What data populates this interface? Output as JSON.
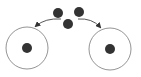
{
  "diagram": {
    "colors": {
      "background": "#ffffff",
      "particle": "#333333",
      "outline": "#888888",
      "arrow": "#444444"
    },
    "source_particles": [
      {
        "id": "p1",
        "cx": 58,
        "cy": 13,
        "r": 5
      },
      {
        "id": "p2",
        "cx": 79,
        "cy": 12,
        "r": 5
      },
      {
        "id": "p3",
        "cx": 68,
        "cy": 24,
        "r": 5
      }
    ],
    "arrows": [
      {
        "id": "arrow-left",
        "from": [
          61,
          19
        ],
        "to": [
          36,
          26
        ],
        "direction": "left"
      },
      {
        "id": "arrow-right",
        "from": [
          78,
          19
        ],
        "to": [
          100,
          27
        ],
        "direction": "right"
      }
    ],
    "containers": [
      {
        "id": "circle-left",
        "cx": 27,
        "cy": 48,
        "r": 21,
        "particle_r": 5
      },
      {
        "id": "circle-right",
        "cx": 110,
        "cy": 49,
        "r": 21,
        "particle_r": 5
      }
    ]
  }
}
